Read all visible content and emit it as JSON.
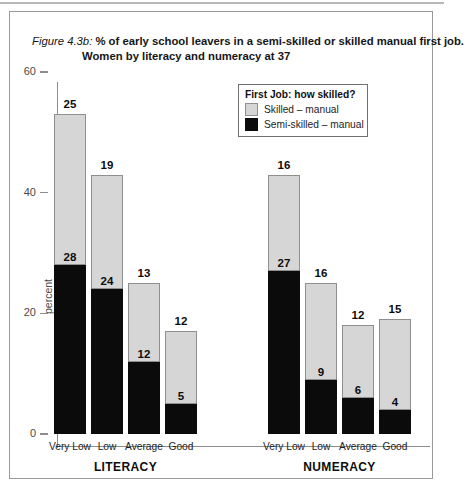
{
  "title": {
    "figure_label": "Figure 4.3b:",
    "line1": "% of early school leavers in a semi-skilled or skilled manual first job.",
    "line2": "Women by literacy and numeracy at 37"
  },
  "legend": {
    "title": "First Job: how skilled?",
    "items": [
      {
        "label": "Skilled – manual",
        "color": "#d6d6d6"
      },
      {
        "label": "Semi-skilled – manual",
        "color": "#0b0b0b"
      }
    ]
  },
  "axis": {
    "ylabel": "percent",
    "yticks": [
      "0",
      "20",
      "40",
      "60"
    ]
  },
  "groups": [
    {
      "name": "LITERACY"
    },
    {
      "name": "NUMERACY"
    }
  ],
  "chart_data": {
    "type": "bar",
    "title": "Figure 4.3b: % of early school leavers in a semi-skilled or skilled manual first job. Women by literacy and numeracy at 37",
    "xlabel": "",
    "ylabel": "percent",
    "ylim": [
      0,
      60
    ],
    "yticks": [
      0,
      20,
      40,
      60
    ],
    "grid": false,
    "stacked": true,
    "legend_position": "top-center",
    "legend_title": "First Job: how skilled?",
    "group_labels": [
      "LITERACY",
      "NUMERACY"
    ],
    "categories": [
      "Very Low",
      "Low",
      "Average",
      "Good",
      "Very Low",
      "Low",
      "Average",
      "Good"
    ],
    "series": [
      {
        "name": "Semi-skilled – manual",
        "color": "#0b0b0b",
        "values": [
          28,
          24,
          12,
          5,
          27,
          9,
          6,
          4
        ]
      },
      {
        "name": "Skilled – manual",
        "color": "#d6d6d6",
        "values": [
          25,
          19,
          13,
          12,
          16,
          16,
          12,
          15
        ]
      }
    ],
    "totals": [
      53,
      43,
      25,
      17,
      43,
      25,
      18,
      19
    ],
    "bars": [
      {
        "group": "LITERACY",
        "category": "Very Low",
        "semi_skilled": 28,
        "skilled": 25,
        "total": 53
      },
      {
        "group": "LITERACY",
        "category": "Low",
        "semi_skilled": 24,
        "skilled": 19,
        "total": 43
      },
      {
        "group": "LITERACY",
        "category": "Average",
        "semi_skilled": 12,
        "skilled": 13,
        "total": 25
      },
      {
        "group": "LITERACY",
        "category": "Good",
        "semi_skilled": 5,
        "skilled": 12,
        "total": 17
      },
      {
        "group": "NUMERACY",
        "category": "Very Low",
        "semi_skilled": 27,
        "skilled": 16,
        "total": 43
      },
      {
        "group": "NUMERACY",
        "category": "Low",
        "semi_skilled": 9,
        "skilled": 16,
        "total": 25
      },
      {
        "group": "NUMERACY",
        "category": "Average",
        "semi_skilled": 6,
        "skilled": 12,
        "total": 18
      },
      {
        "group": "NUMERACY",
        "category": "Good",
        "semi_skilled": 4,
        "skilled": 15,
        "total": 19
      }
    ],
    "bar_labels_top": [
      "25",
      "19",
      "13",
      "12",
      "16",
      "16",
      "12",
      "15"
    ],
    "bar_labels_inner": [
      "28",
      "24",
      "12",
      "5",
      "27",
      "9",
      "6",
      "4"
    ]
  }
}
